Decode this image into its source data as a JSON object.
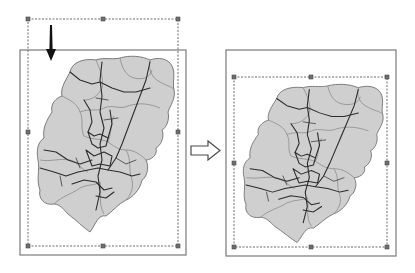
{
  "diagram": {
    "colors": {
      "region_fill": "#cfcfcf",
      "region_stroke": "#6f6f6f",
      "road": "#2c2c2c",
      "frame": "#7a7a7a",
      "handle": "#6e6e6e",
      "arrow": "#111111"
    },
    "panels": [
      {
        "id": "before",
        "page_frame": {
          "x": 20,
          "y": 50,
          "w": 166,
          "h": 205
        },
        "selection_frame": {
          "x": 28,
          "y": 19,
          "w": 150,
          "h": 227
        },
        "indicator": "down-arrow"
      },
      {
        "id": "after",
        "page_frame": {
          "x": 226,
          "y": 50,
          "w": 170,
          "h": 206
        },
        "selection_frame": {
          "x": 234,
          "y": 77,
          "w": 153,
          "h": 170
        },
        "indicator": "none"
      }
    ],
    "transition": "right-arrow"
  }
}
